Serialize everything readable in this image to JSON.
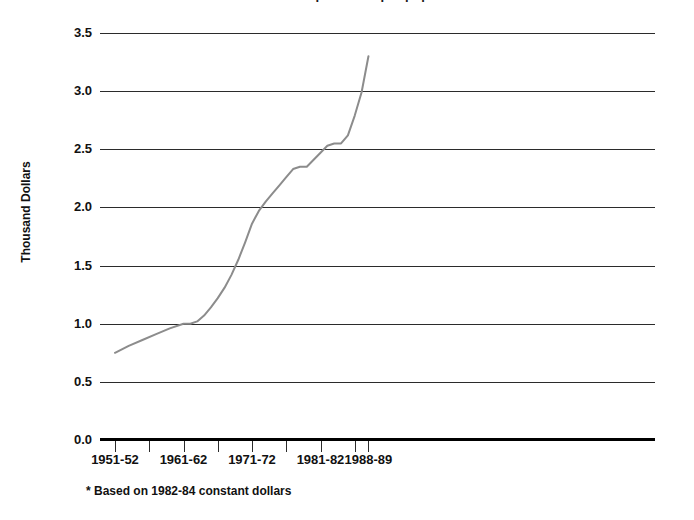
{
  "chart_data": {
    "type": "line",
    "title": "Annual expenditure per pupil*",
    "xlabel": "",
    "ylabel": "Thousand Dollars",
    "ylim": [
      0.0,
      3.5
    ],
    "yticks": [
      "0.0",
      "0.5",
      "1.0",
      "1.5",
      "2.0",
      "2.5",
      "3.0",
      "3.5"
    ],
    "ytick_values": [
      0.0,
      0.5,
      1.0,
      1.5,
      2.0,
      2.5,
      3.0,
      3.5
    ],
    "xtick_labels": [
      "1951-52",
      "1961-62",
      "1971-72",
      "1981-82",
      "1988-89"
    ],
    "xtick_values": [
      1951,
      1961,
      1971,
      1981,
      1988
    ],
    "grid": "horizontal",
    "legend": "none",
    "line_color": "#8c8c8c",
    "axis_color": "#2b2b2b",
    "series": [
      {
        "name": "Annual expenditure per pupil",
        "x": [
          1951,
          1953,
          1955,
          1957,
          1959,
          1961,
          1962,
          1963,
          1964,
          1965,
          1966,
          1967,
          1968,
          1969,
          1970,
          1971,
          1972,
          1973,
          1974,
          1975,
          1976,
          1977,
          1978,
          1979,
          1980,
          1981,
          1982,
          1983,
          1984,
          1985,
          1986,
          1987,
          1988
        ],
        "values": [
          0.75,
          0.81,
          0.86,
          0.91,
          0.96,
          1.0,
          1.0,
          1.02,
          1.07,
          1.14,
          1.22,
          1.31,
          1.42,
          1.55,
          1.7,
          1.86,
          1.97,
          2.05,
          2.12,
          2.19,
          2.26,
          2.33,
          2.35,
          2.35,
          2.41,
          2.47,
          2.53,
          2.55,
          2.55,
          2.62,
          2.79,
          2.99,
          3.3
        ]
      }
    ],
    "annotations": [
      {
        "id": "footnote",
        "text": "* Based on 1982-84 constant dollars"
      }
    ]
  },
  "axes": {
    "y_title": "Thousand Dollars",
    "y_ticks": [
      "3.5",
      "3.0",
      "2.5",
      "2.0",
      "1.5",
      "1.0",
      "0.5",
      "0.0"
    ],
    "x_ticks": [
      "1951-52",
      "1961-62",
      "1971-72",
      "1981-82",
      "1988-89"
    ]
  },
  "footnote": {
    "text": "* Based on 1982-84 constant dollars"
  },
  "title": {
    "text": "Annual expenditure per pupil*"
  }
}
